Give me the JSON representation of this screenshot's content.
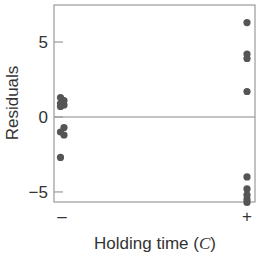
{
  "chart_data": {
    "type": "scatter",
    "title": "",
    "xlabel": "Holding time (C)",
    "xlabel_parts": {
      "prefix": "Holding time (",
      "italic": "C",
      "suffix": ")"
    },
    "ylabel": "Residuals",
    "categories": [
      "–",
      "+"
    ],
    "ylim": [
      -5.67,
      7.47
    ],
    "yticks": [
      -5,
      0,
      5
    ],
    "ytick_labels": [
      "−5",
      "0",
      "5"
    ],
    "grid": false,
    "reference_line": 0,
    "legend": null,
    "series": [
      {
        "name": "Residuals",
        "color": "#555555",
        "points": [
          {
            "x": "–",
            "y": 1.3
          },
          {
            "x": "–",
            "y": 1.1
          },
          {
            "x": "–",
            "y": 0.9
          },
          {
            "x": "–",
            "y": 0.8
          },
          {
            "x": "–",
            "y": 0.7
          },
          {
            "x": "–",
            "y": -0.7
          },
          {
            "x": "–",
            "y": -1.0
          },
          {
            "x": "–",
            "y": -1.2
          },
          {
            "x": "–",
            "y": -2.7
          },
          {
            "x": "+",
            "y": 6.3
          },
          {
            "x": "+",
            "y": 4.2
          },
          {
            "x": "+",
            "y": 3.9
          },
          {
            "x": "+",
            "y": 1.7
          },
          {
            "x": "+",
            "y": -4.0
          },
          {
            "x": "+",
            "y": -4.8
          },
          {
            "x": "+",
            "y": -5.2
          },
          {
            "x": "+",
            "y": -5.5
          },
          {
            "x": "+",
            "y": -5.7
          }
        ]
      }
    ]
  },
  "colors": {
    "axis": "#9a9a9a",
    "zero_line": "#8a8a8a",
    "point": "#555555",
    "text": "#333333"
  }
}
